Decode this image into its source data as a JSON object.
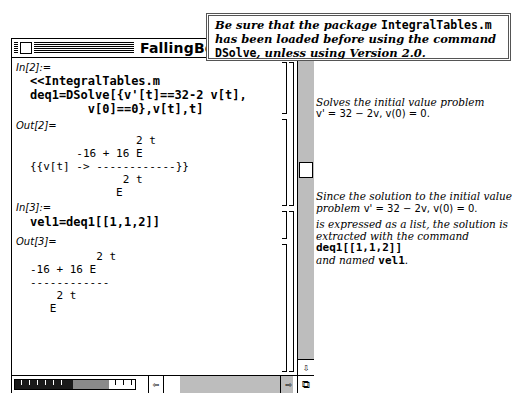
{
  "window": {
    "title": "FallingBodies"
  },
  "note": {
    "line1_text": "Be sure that the package ",
    "line1_code": "IntegralTables.m",
    "line2_text": "has been loaded before using the command",
    "line3_code": "DSolve",
    "line3_text": ", unless using Version 2.0."
  },
  "cells": [
    {
      "label": "In[2]:=",
      "type": "input",
      "lines": [
        "<<IntegralTables.m",
        "deq1=DSolve[{v'[t]==32-2 v[t],",
        "        v[0]==0},v[t],t]"
      ]
    },
    {
      "label": "Out[2]=",
      "type": "output",
      "lines": [
        "                2 t",
        "       -16 + 16 E",
        "{{v[t] -> ------------}}",
        "              2 t",
        "             E"
      ]
    },
    {
      "label": "In[3]:=",
      "type": "input",
      "lines": [
        "vel1=deq1[[1,1,2]]"
      ]
    },
    {
      "label": "Out[3]=",
      "type": "output",
      "lines": [
        "          2 t",
        "-16 + 16 E",
        "------------",
        "    2 t",
        "   E"
      ]
    }
  ],
  "annotations": {
    "first": {
      "line1": "Solves the initial value problem",
      "line2": "v' = 32 − 2v,  v(0) = 0."
    },
    "second": {
      "line1": "Since the solution to the initial value",
      "line2_text": "problem  ",
      "line2_eq": "v' = 32 − 2v,  v(0) = 0.",
      "line3": "is expressed as a list, the solution is",
      "line4": "extracted with the command",
      "line5_code": "deq1[[1,1,2]]",
      "line6_text": "and named ",
      "line6_code": "vel1",
      "line6_end": "."
    }
  },
  "scrollbar": {
    "up_arrow": "⇧",
    "down_arrow": "⇩",
    "left_arrow": "⇦",
    "right_arrow": "⇨",
    "grow_box": "⧉"
  }
}
